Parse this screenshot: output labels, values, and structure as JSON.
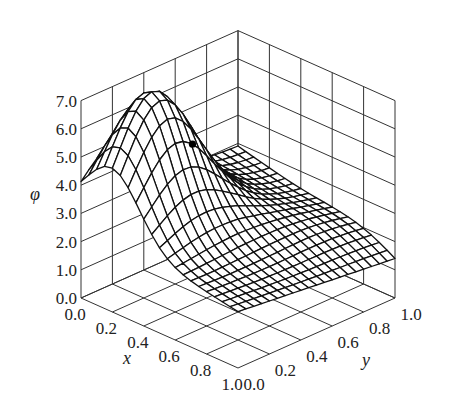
{
  "chart_data": {
    "type": "surface3d",
    "title": "",
    "xlabel": "x",
    "ylabel": "y",
    "zlabel": "φ",
    "xlim": [
      0.0,
      1.0
    ],
    "ylim": [
      0.0,
      1.0
    ],
    "zlim": [
      0.0,
      7.0
    ],
    "x_ticks": [
      "0.0",
      "0.2",
      "0.4",
      "0.6",
      "0.8",
      "1.0"
    ],
    "y_ticks": [
      "0.0",
      "0.2",
      "0.4",
      "0.6",
      "0.8",
      "1.0"
    ],
    "z_ticks": [
      "0.0",
      "1.0",
      "2.0",
      "3.0",
      "4.0",
      "5.0",
      "6.0",
      "7.0"
    ],
    "grid": true,
    "mesh_resolution": 20,
    "surface_samples": [
      {
        "x": 0.0,
        "y": 0.0,
        "phi": 3.0
      },
      {
        "x": 1.0,
        "y": 0.0,
        "phi": 2.0
      },
      {
        "x": 1.0,
        "y": 1.0,
        "phi": 1.4
      },
      {
        "x": 0.0,
        "y": 1.0,
        "phi": 2.9
      },
      {
        "x": 0.2,
        "y": 0.25,
        "phi": 7.2
      }
    ],
    "surface_model": {
      "corners": {
        "x0y0": 3.0,
        "x1y0": 2.0,
        "x0y1": 2.9,
        "x1y1": 1.4
      },
      "peak": {
        "x": 0.2,
        "y": 0.25,
        "amplitude": 4.3,
        "sigma_x": 0.17,
        "sigma_y": 0.22
      },
      "ridge": {
        "amplitude": 1.2,
        "sigma": 0.3
      }
    },
    "marked_point": {
      "x": 0.35,
      "y": 0.36,
      "phi": 4.85,
      "label": ""
    }
  },
  "labels": {
    "x": "x",
    "y": "y",
    "z": "φ"
  }
}
